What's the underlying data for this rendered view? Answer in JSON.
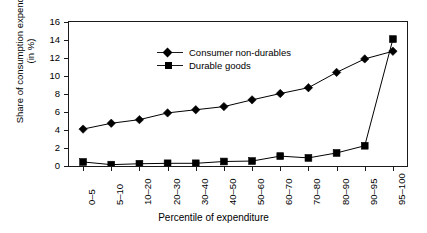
{
  "chart_data": {
    "type": "line",
    "title": "",
    "xlabel": "Percentile of expenditure",
    "ylabel": "Share of consumption expenditure (in %)",
    "ylabel_line1": "Share of consumption expenditure",
    "ylabel_line2": "(in %)",
    "ylim": [
      0,
      16
    ],
    "ytick_step": 2,
    "yticks": [
      0,
      2,
      4,
      6,
      8,
      10,
      12,
      14,
      16
    ],
    "grid": false,
    "legend_position": "top-left",
    "categories": [
      "0–5",
      "5–10",
      "10–20",
      "20–30",
      "30–40",
      "40–50",
      "50–60",
      "60–70",
      "70–80",
      "80–90",
      "90–95",
      "95–100"
    ],
    "series": [
      {
        "name": "Consumer non-durables",
        "marker": "diamond",
        "color": "#000000",
        "values": [
          4.1,
          4.75,
          5.15,
          5.9,
          6.25,
          6.6,
          7.35,
          8.05,
          8.7,
          10.4,
          11.9,
          12.75
        ]
      },
      {
        "name": "Durable goods",
        "marker": "square",
        "color": "#000000",
        "values": [
          0.45,
          0.15,
          0.25,
          0.3,
          0.3,
          0.5,
          0.55,
          1.1,
          0.9,
          1.45,
          2.25,
          14.1
        ]
      }
    ]
  }
}
